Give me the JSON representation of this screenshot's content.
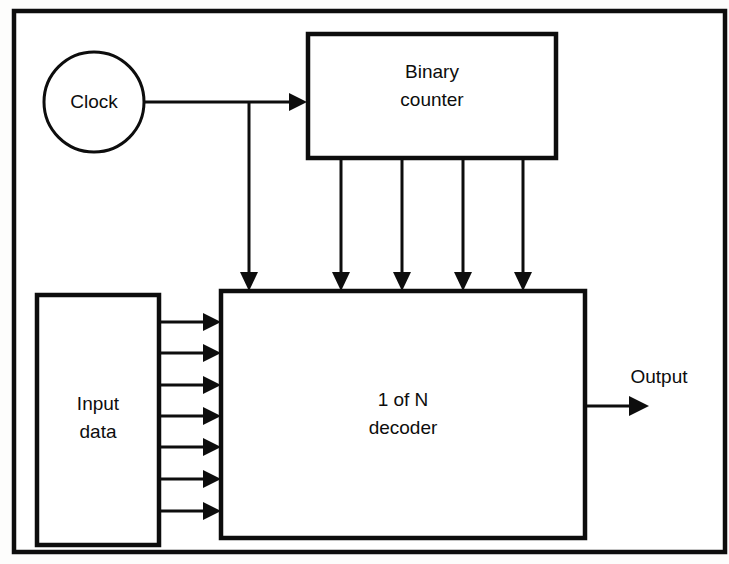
{
  "diagram": {
    "background_color": "#fdfdfc",
    "line_color": "#0d0d0d",
    "frame": {
      "name": "outer-frame",
      "x": 14,
      "y": 11,
      "width": 711,
      "height": 541
    },
    "blocks": [
      {
        "id": "clock",
        "shape": "circle",
        "label": "Clock",
        "cx": 94,
        "cy": 102,
        "r": 50
      },
      {
        "id": "binary-counter",
        "shape": "rect",
        "label_line1": "Binary",
        "label_line2": "counter",
        "x": 308,
        "y": 34,
        "width": 248,
        "height": 124
      },
      {
        "id": "input-data",
        "shape": "rect",
        "label_line1": "Input",
        "label_line2": "data",
        "x": 37,
        "y": 295,
        "width": 122,
        "height": 250
      },
      {
        "id": "decoder",
        "shape": "rect",
        "label_line1": "1 of N",
        "label_line2": "decoder",
        "x": 221,
        "y": 291,
        "width": 364,
        "height": 247
      }
    ],
    "connections": [
      {
        "id": "clock-to-counter",
        "from": "clock",
        "to": "binary-counter",
        "label": ""
      },
      {
        "id": "clock-to-decoder",
        "from": "clock",
        "to": "decoder",
        "label": ""
      },
      {
        "id": "counter-to-decoder-bus",
        "from": "binary-counter",
        "to": "decoder",
        "line_count": 4,
        "label": ""
      },
      {
        "id": "input-to-decoder-bus",
        "from": "input-data",
        "to": "decoder",
        "line_count": 7,
        "label": ""
      },
      {
        "id": "decoder-output",
        "from": "decoder",
        "to": "",
        "label": "Output"
      }
    ],
    "labels": {
      "output": "Output"
    }
  }
}
